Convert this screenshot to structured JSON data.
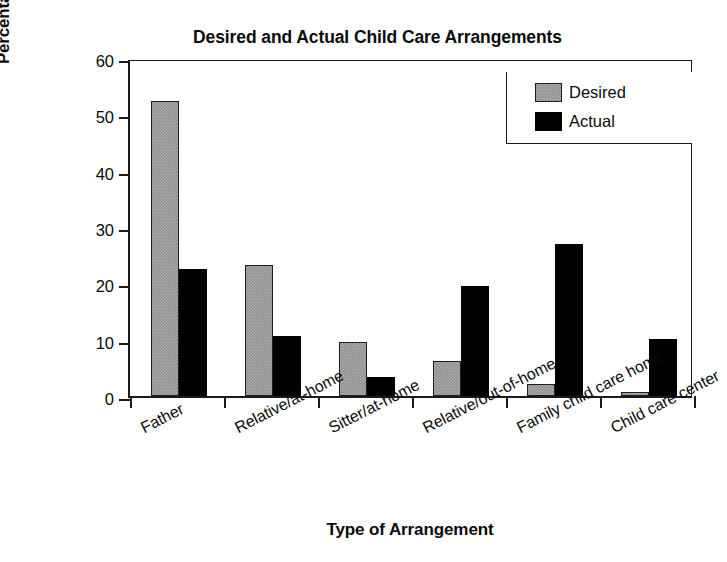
{
  "chart_data": {
    "type": "bar",
    "title": "Desired and Actual Child Care Arrangements",
    "xlabel": "Type of Arrangement",
    "ylabel": "Percentage of families",
    "ylim": [
      0,
      60
    ],
    "yticks": [
      0,
      10,
      20,
      30,
      40,
      50,
      60
    ],
    "ytick_labels": [
      "0",
      "10",
      "20",
      "30",
      "40",
      "50",
      "60"
    ],
    "grid": false,
    "legend_position": "top-right",
    "categories": [
      "Father",
      "Relative/at-home",
      "Sitter/at-home",
      "Relative/out-of-home",
      "Family child care home",
      "Child care center"
    ],
    "series": [
      {
        "name": "Desired",
        "color": "#8f8f8f",
        "values": [
          52.4,
          23.3,
          9.5,
          6.2,
          2.2,
          0.8
        ]
      },
      {
        "name": "Actual",
        "color": "#000000",
        "values": [
          22.6,
          10.7,
          3.4,
          19.6,
          27.0,
          10.2
        ]
      }
    ]
  },
  "legend": {
    "entries": [
      {
        "label": "Desired"
      },
      {
        "label": "Actual"
      }
    ]
  }
}
